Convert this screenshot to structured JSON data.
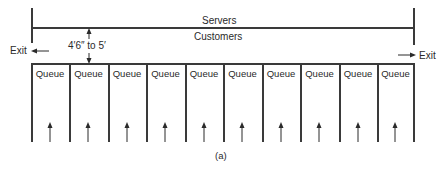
{
  "diagram": {
    "labels": {
      "servers": "Servers",
      "customers": "Customers",
      "dimension": "4′6″ to 5′",
      "exit_left": "Exit",
      "exit_right": "Exit",
      "caption": "(a)"
    },
    "queues": [
      {
        "label": "Queue"
      },
      {
        "label": "Queue"
      },
      {
        "label": "Queue"
      },
      {
        "label": "Queue"
      },
      {
        "label": "Queue"
      },
      {
        "label": "Queue"
      },
      {
        "label": "Queue"
      },
      {
        "label": "Queue"
      },
      {
        "label": "Queue"
      },
      {
        "label": "Queue"
      }
    ],
    "line_color": "#3a3a3a"
  }
}
